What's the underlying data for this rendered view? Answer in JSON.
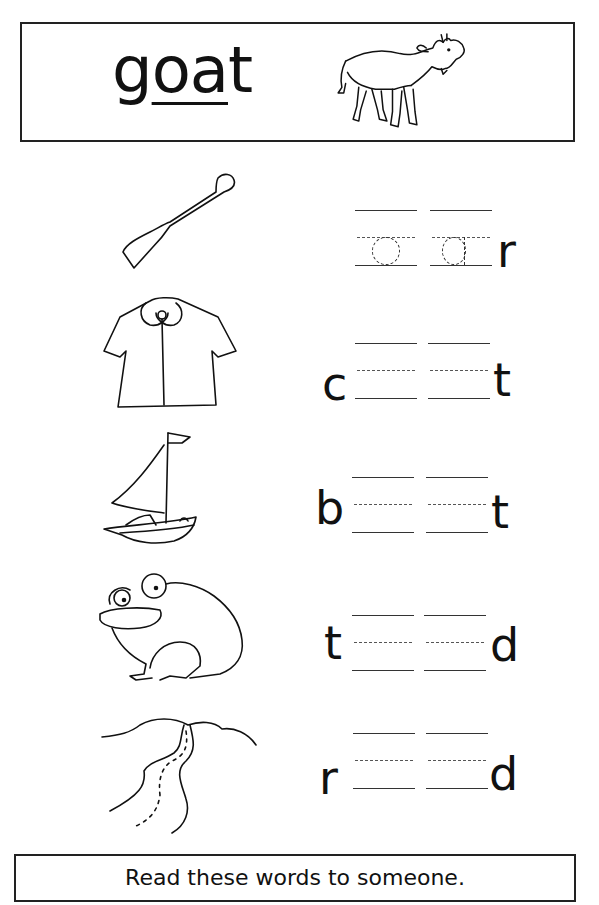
{
  "header": {
    "key_word_start": "g",
    "key_word_vowels": "oa",
    "key_word_end": "t",
    "picture": "goat-illustration"
  },
  "rows": [
    {
      "picture": "oar-illustration",
      "first_letter": "",
      "blank1_trace": "o",
      "blank2_trace": "a",
      "last_letter": "r"
    },
    {
      "picture": "coat-illustration",
      "first_letter": "c",
      "blank1_trace": "",
      "blank2_trace": "",
      "last_letter": "t"
    },
    {
      "picture": "boat-illustration",
      "first_letter": "b",
      "blank1_trace": "",
      "blank2_trace": "",
      "last_letter": "t"
    },
    {
      "picture": "toad-illustration",
      "first_letter": "t",
      "blank1_trace": "",
      "blank2_trace": "",
      "last_letter": "d"
    },
    {
      "picture": "road-illustration",
      "first_letter": "r",
      "blank1_trace": "",
      "blank2_trace": "",
      "last_letter": "d"
    }
  ],
  "footer": {
    "instruction": "Read these words to someone."
  }
}
